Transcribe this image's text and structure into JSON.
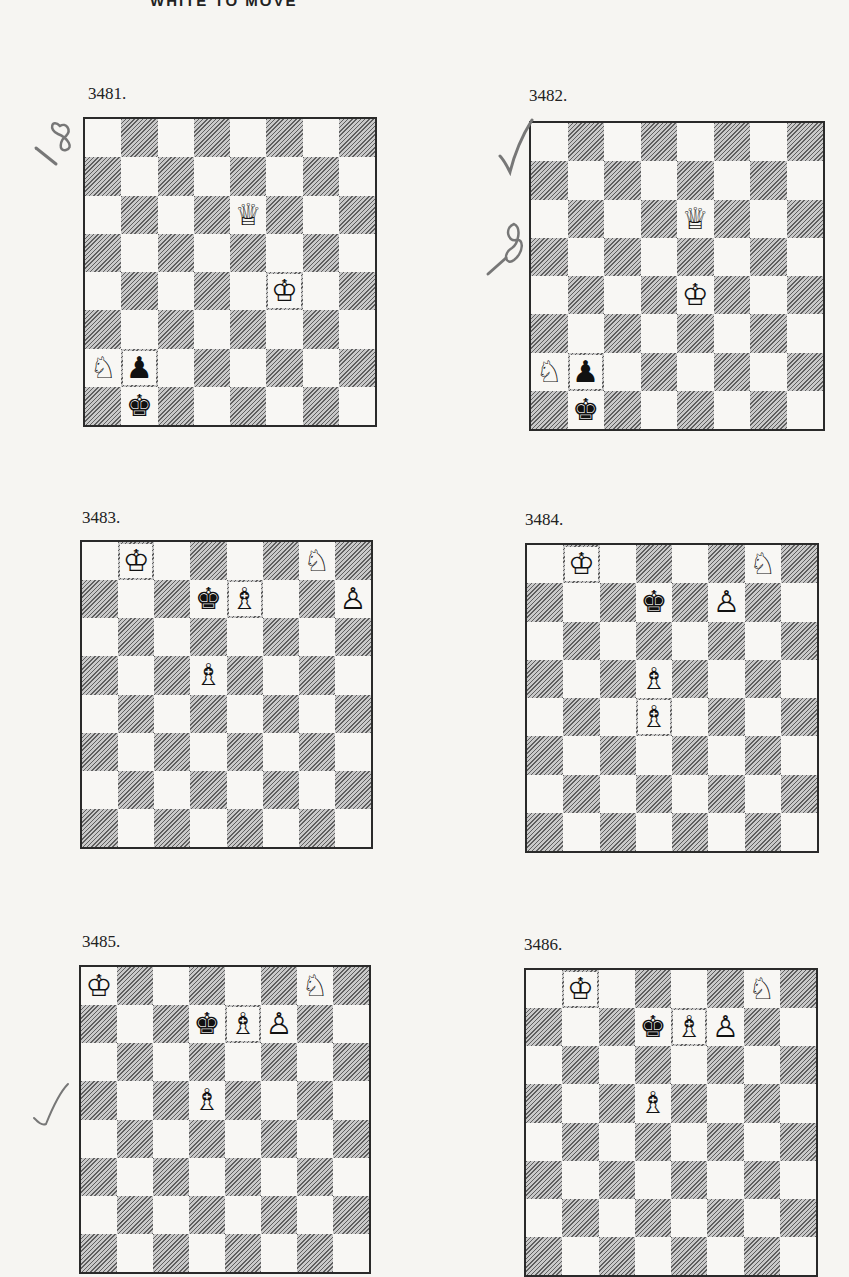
{
  "page": {
    "heading": "WHITE TO MOVE"
  },
  "colors": {
    "dark_square_hatch": "#5f5f5f",
    "light_square": "#f8f7f4",
    "board_border": "#2a2a2a",
    "annotation_ink": "#6a6a6a"
  },
  "diagrams": [
    {
      "number": "3481.",
      "left": 83,
      "top": 117,
      "width": 294,
      "height": 310,
      "label_left": 88,
      "label_top": 84,
      "pieces": [
        {
          "square": "e6",
          "row": 2,
          "col": 4,
          "piece": "queen",
          "color": "white",
          "glyph": "♕"
        },
        {
          "square": "f4",
          "row": 4,
          "col": 5,
          "piece": "king",
          "color": "white",
          "glyph": "♔"
        },
        {
          "square": "a2",
          "row": 6,
          "col": 0,
          "piece": "knight",
          "color": "white",
          "glyph": "♘"
        },
        {
          "square": "b2",
          "row": 6,
          "col": 1,
          "piece": "pawn",
          "color": "black",
          "glyph": "♟"
        },
        {
          "square": "b1",
          "row": 7,
          "col": 1,
          "piece": "king",
          "color": "black",
          "glyph": "♚"
        }
      ],
      "annotation": {
        "text": "18",
        "type": "handwritten-number",
        "left": 32,
        "top": 112,
        "rotate": -50
      }
    },
    {
      "number": "3482.",
      "left": 529,
      "top": 121,
      "width": 296,
      "height": 310,
      "label_left": 529,
      "label_top": 86,
      "pieces": [
        {
          "square": "e6",
          "row": 2,
          "col": 4,
          "piece": "queen",
          "color": "white",
          "glyph": "♕"
        },
        {
          "square": "f4",
          "row": 4,
          "col": 4,
          "piece": "king",
          "color": "white",
          "glyph": "♔"
        },
        {
          "square": "a2",
          "row": 6,
          "col": 0,
          "piece": "knight",
          "color": "white",
          "glyph": "♘"
        },
        {
          "square": "b2",
          "row": 6,
          "col": 1,
          "piece": "pawn",
          "color": "black",
          "glyph": "♟"
        },
        {
          "square": "b1",
          "row": 7,
          "col": 1,
          "piece": "king",
          "color": "black",
          "glyph": "♚"
        }
      ],
      "annotation": {
        "text": "18",
        "type": "checkmark-and-number",
        "left": 490,
        "top": 200,
        "rotate": -55
      }
    },
    {
      "number": "3483.",
      "left": 80,
      "top": 540,
      "width": 293,
      "height": 309,
      "label_left": 82,
      "label_top": 508,
      "pieces": [
        {
          "square": "b8",
          "row": 0,
          "col": 1,
          "piece": "king",
          "color": "white",
          "glyph": "♔"
        },
        {
          "square": "g8",
          "row": 0,
          "col": 6,
          "piece": "knight",
          "color": "white",
          "glyph": "♘"
        },
        {
          "square": "d7",
          "row": 1,
          "col": 3,
          "piece": "king",
          "color": "black",
          "glyph": "♚"
        },
        {
          "square": "e7",
          "row": 1,
          "col": 4,
          "piece": "bishop",
          "color": "white",
          "glyph": "♗"
        },
        {
          "square": "h7",
          "row": 1,
          "col": 7,
          "piece": "pawn",
          "color": "white",
          "glyph": "♙"
        },
        {
          "square": "d5",
          "row": 3,
          "col": 3,
          "piece": "bishop",
          "color": "white",
          "glyph": "♗"
        }
      ]
    },
    {
      "number": "3484.",
      "left": 525,
      "top": 543,
      "width": 294,
      "height": 310,
      "label_left": 525,
      "label_top": 510,
      "pieces": [
        {
          "square": "b8",
          "row": 0,
          "col": 1,
          "piece": "king",
          "color": "white",
          "glyph": "♔"
        },
        {
          "square": "g8",
          "row": 0,
          "col": 6,
          "piece": "knight",
          "color": "white",
          "glyph": "♘"
        },
        {
          "square": "d7",
          "row": 1,
          "col": 3,
          "piece": "king",
          "color": "black",
          "glyph": "♚"
        },
        {
          "square": "f7",
          "row": 1,
          "col": 5,
          "piece": "pawn",
          "color": "white",
          "glyph": "♙"
        },
        {
          "square": "d5",
          "row": 3,
          "col": 3,
          "piece": "bishop",
          "color": "white",
          "glyph": "♗"
        },
        {
          "square": "d4",
          "row": 4,
          "col": 3,
          "piece": "bishop",
          "color": "white",
          "glyph": "♗"
        }
      ]
    },
    {
      "number": "3485.",
      "left": 79,
      "top": 965,
      "width": 292,
      "height": 309,
      "label_left": 82,
      "label_top": 932,
      "pieces": [
        {
          "square": "a8",
          "row": 0,
          "col": 0,
          "piece": "king",
          "color": "white",
          "glyph": "♔"
        },
        {
          "square": "g8",
          "row": 0,
          "col": 6,
          "piece": "knight",
          "color": "white",
          "glyph": "♘"
        },
        {
          "square": "d7",
          "row": 1,
          "col": 3,
          "piece": "king",
          "color": "black",
          "glyph": "♚"
        },
        {
          "square": "e7",
          "row": 1,
          "col": 4,
          "piece": "bishop",
          "color": "white",
          "glyph": "♗"
        },
        {
          "square": "f7",
          "row": 1,
          "col": 5,
          "piece": "pawn",
          "color": "white",
          "glyph": "♙"
        },
        {
          "square": "d5",
          "row": 3,
          "col": 3,
          "piece": "bishop",
          "color": "white",
          "glyph": "♗"
        }
      ],
      "annotation": {
        "type": "checkmark",
        "left": 34,
        "top": 1082
      }
    },
    {
      "number": "3486.",
      "left": 524,
      "top": 968,
      "width": 294,
      "height": 309,
      "label_left": 524,
      "label_top": 935,
      "pieces": [
        {
          "square": "b8",
          "row": 0,
          "col": 1,
          "piece": "king",
          "color": "white",
          "glyph": "♔"
        },
        {
          "square": "g8",
          "row": 0,
          "col": 6,
          "piece": "knight",
          "color": "white",
          "glyph": "♘"
        },
        {
          "square": "d7",
          "row": 1,
          "col": 3,
          "piece": "king",
          "color": "black",
          "glyph": "♚"
        },
        {
          "square": "e7",
          "row": 1,
          "col": 4,
          "piece": "bishop",
          "color": "white",
          "glyph": "♗"
        },
        {
          "square": "f7",
          "row": 1,
          "col": 5,
          "piece": "pawn",
          "color": "white",
          "glyph": "♙"
        },
        {
          "square": "d5",
          "row": 3,
          "col": 3,
          "piece": "bishop",
          "color": "white",
          "glyph": "♗"
        }
      ]
    }
  ]
}
